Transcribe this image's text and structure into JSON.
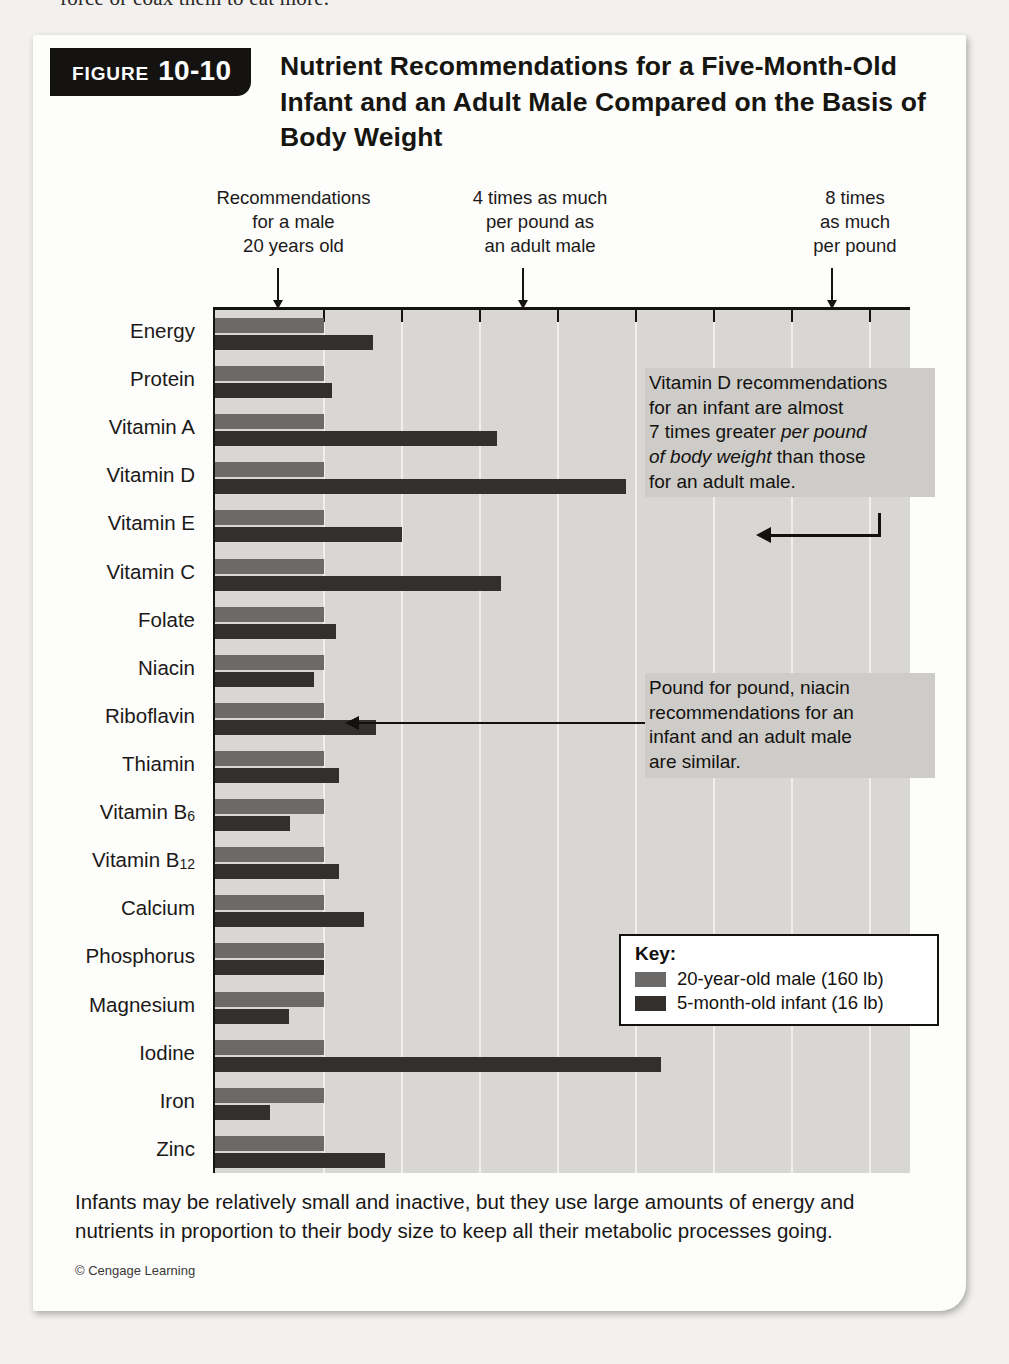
{
  "bleed_text": "force or coax them to eat more.",
  "figure": {
    "tag_word": "FIGURE",
    "tag_number": "10-10",
    "title": "Nutrient Recommendations for a Five-Month-Old Infant and an Adult Male Compared on the Basis of Body Weight",
    "caption": "Infants may be relatively small and inactive, but they use large amounts of energy and nutrients in proportion to their body size to keep all their metabolic processes going.",
    "credit": "© Cengage Learning"
  },
  "column_notes": [
    {
      "text": "Recommendations\nfor a male\n20 years old",
      "arrow_value": 1
    },
    {
      "text": "4 times as much\nper pound as\nan adult male",
      "arrow_value": 4
    },
    {
      "text": "8 times\nas much\nper pound",
      "arrow_value": 8
    }
  ],
  "callouts": [
    {
      "id": "vitamin-d",
      "lines": [
        {
          "text": "Vitamin D recommendations"
        },
        {
          "text": "for an infant are almost"
        },
        {
          "text": "7 times greater ",
          "em": "per pound"
        },
        {
          "em": "of body weight",
          "text": " than those"
        },
        {
          "text": "for an adult male."
        }
      ],
      "plain": "Vitamin D recommendations for an infant are almost 7 times greater per pound of body weight than those for an adult male."
    },
    {
      "id": "niacin",
      "plain": "Pound for pound, niacin recommendations for an infant and an adult male are similar.",
      "lines": [
        {
          "text": "Pound for pound, niacin"
        },
        {
          "text": "recommendations for an"
        },
        {
          "text": "infant and an adult male"
        },
        {
          "text": "are similar."
        }
      ]
    }
  ],
  "key": {
    "title": "Key:",
    "items": [
      {
        "label": "20-year-old male (160 lb)",
        "color": "#6c6a68"
      },
      {
        "label": "5-month-old infant (16 lb)",
        "color": "#332f2c"
      }
    ]
  },
  "chart_data": {
    "type": "bar",
    "orientation": "horizontal",
    "title": "Nutrient Recommendations for a Five-Month-Old Infant and an Adult Male Compared on the Basis of Body Weight",
    "xlabel": "Relative recommendation per pound of body weight (adult male = 1)",
    "ylabel": "",
    "xlim": [
      0,
      8.9
    ],
    "xticks": [
      1,
      2,
      3,
      4,
      5,
      6,
      7,
      8
    ],
    "grid": true,
    "legend_position": "inside-bottom-right",
    "categories": [
      "Energy",
      "Protein",
      "Vitamin A",
      "Vitamin D",
      "Vitamin E",
      "Vitamin C",
      "Folate",
      "Niacin",
      "Riboflavin",
      "Thiamin",
      "Vitamin B6",
      "Vitamin B12",
      "Calcium",
      "Phosphorus",
      "Magnesium",
      "Iodine",
      "Iron",
      "Zinc"
    ],
    "category_labels_html": [
      "Energy",
      "Protein",
      "Vitamin A",
      "Vitamin D",
      "Vitamin E",
      "Vitamin C",
      "Folate",
      "Niacin",
      "Riboflavin",
      "Thiamin",
      "Vitamin B<sub>6</sub>",
      "Vitamin B<sub>12</sub>",
      "Calcium",
      "Phosphorus",
      "Magnesium",
      "Iodine",
      "Iron",
      "Zinc"
    ],
    "series": [
      {
        "name": "20-year-old male (160 lb)",
        "color": "#6c6a68",
        "values": [
          1,
          1,
          1,
          1,
          1,
          1,
          1,
          1,
          1,
          1,
          1,
          1,
          1,
          1,
          1,
          1,
          1,
          1
        ]
      },
      {
        "name": "5-month-old infant (16 lb)",
        "color": "#332f2c",
        "values": [
          1.63,
          1.1,
          3.22,
          4.87,
          2.0,
          3.27,
          1.15,
          0.87,
          1.67,
          1.19,
          0.56,
          1.19,
          1.51,
          1.0,
          0.55,
          5.32,
          0.31,
          1.78
        ]
      }
    ],
    "annotations": [
      {
        "target": "Vitamin D",
        "text": "Vitamin D recommendations for an infant are almost 7 times greater per pound of body weight than those for an adult male."
      },
      {
        "target": "Niacin",
        "text": "Pound for pound, niacin recommendations for an infant and an adult male are similar."
      }
    ]
  }
}
